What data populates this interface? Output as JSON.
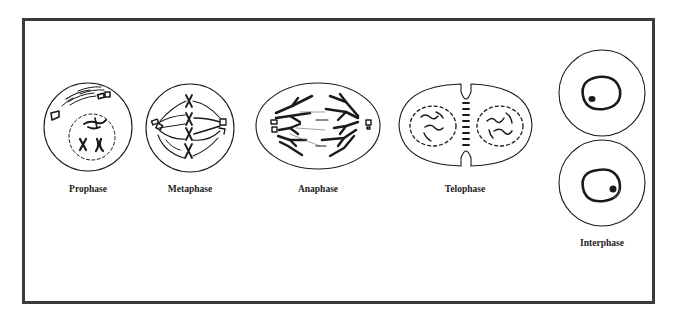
{
  "diagram": {
    "title": "",
    "phases": [
      {
        "id": "prophase",
        "label": "Prophase"
      },
      {
        "id": "metaphase",
        "label": "Metaphase"
      },
      {
        "id": "anaphase",
        "label": "Anaphase"
      },
      {
        "id": "telophase",
        "label": "Telophase"
      },
      {
        "id": "interphase",
        "label": "Interphase"
      }
    ]
  },
  "colors": {
    "frame": "#3a3a3a",
    "ink": "#1a1a1a",
    "background": "#ffffff"
  }
}
